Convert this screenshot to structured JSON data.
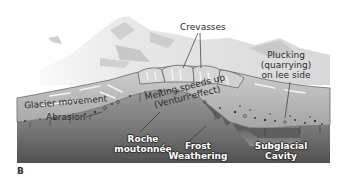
{
  "figure": {
    "panel_letter": "B",
    "colors": {
      "sky": "#ffffff",
      "mountain_light": "#e6e6e6",
      "mountain_shadow": "#c8c8c8",
      "ice": "#b9b9b9",
      "ice_streak": "#f2f2f2",
      "bedrock_top": "#8c8c8c",
      "bedrock_bottom": "#555555",
      "debris": "#3a3a3a",
      "label_text": "#2b2b2b"
    }
  },
  "labels": {
    "crevasses": "Crevasses",
    "plucking_line1": "Plucking",
    "plucking_line2": "(quarrying)",
    "plucking_line3": "on lee side",
    "glacier_movement": "Glacier movement",
    "melting_line1": "Melting speeds up",
    "melting_line2": "(Venturi effect)",
    "abrasion": "Abrasion",
    "roche_line1": "Roche",
    "roche_line2": "moutonnée",
    "frost_line1": "Frost",
    "frost_line2": "Weathering",
    "cavity_line1": "Subglacial",
    "cavity_line2": "Cavity"
  }
}
